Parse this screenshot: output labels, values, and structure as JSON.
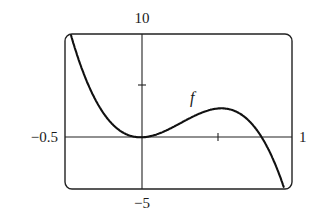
{
  "chart_data": {
    "type": "line",
    "title": "",
    "xlabel": "",
    "ylabel": "",
    "xlim": [
      -0.5,
      1
    ],
    "ylim": [
      -5,
      10
    ],
    "grid": false,
    "legend": "none",
    "tick_labels": {
      "x_min": "−0.5",
      "x_max": "1",
      "y_max": "10",
      "y_min": "−5"
    },
    "x_ticks": [
      0.5
    ],
    "y_ticks": [
      5
    ],
    "annotations": [
      {
        "text": "f",
        "x": 0.35,
        "y": 3.3
      }
    ],
    "series": [
      {
        "name": "f",
        "x": [
          -0.46,
          -0.4,
          -0.3,
          -0.2,
          -0.1,
          0.0,
          0.1,
          0.2,
          0.3,
          0.4,
          0.5,
          0.6,
          0.7,
          0.8,
          0.9,
          0.96
        ],
        "values": [
          10.0,
          7.1,
          3.7,
          1.5,
          0.3,
          0.0,
          0.3,
          0.9,
          1.7,
          2.4,
          2.8,
          2.7,
          1.8,
          0.0,
          -3.0,
          -5.0
        ]
      }
    ]
  }
}
